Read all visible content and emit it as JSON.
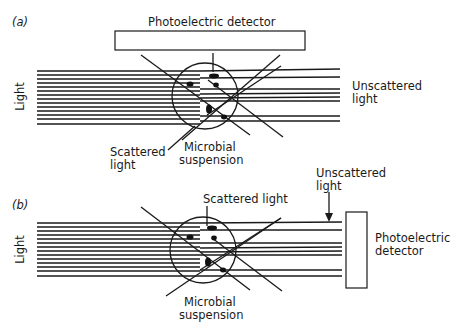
{
  "panels": [
    {
      "id": "a",
      "tag": "(a)",
      "detector_label": "Photoelectric detector",
      "light_label": "Light",
      "unscattered_label_line1": "Unscattered",
      "unscattered_label_line2": "light",
      "scattered_label_line1": "Scattered",
      "scattered_label_line2": "light",
      "suspension_label_line1": "Microbial",
      "suspension_label_line2": "suspension"
    },
    {
      "id": "b",
      "tag": "(b)",
      "scattered_label": "Scattered light",
      "unscattered_label_line1": "Unscattered",
      "unscattered_label_line2": "light",
      "detector_label_line1": "Photoelectric",
      "detector_label_line2": "detector",
      "light_label": "Light",
      "suspension_label_line1": "Microbial",
      "suspension_label_line2": "suspension"
    }
  ],
  "colors": {
    "ink": "#1a1a1a",
    "background": "#ffffff"
  }
}
